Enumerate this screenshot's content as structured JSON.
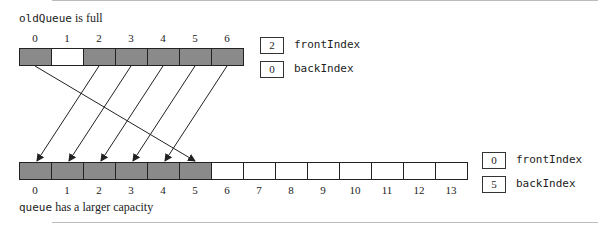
{
  "top": {
    "caption_code": "oldQueue",
    "caption_text": " is full",
    "indices": [
      "0",
      "1",
      "2",
      "3",
      "4",
      "5",
      "6"
    ],
    "filled": [
      true,
      false,
      true,
      true,
      true,
      true,
      true
    ],
    "front_value": "2",
    "front_label": "frontIndex",
    "back_value": "0",
    "back_label": "backIndex"
  },
  "bottom": {
    "caption_code": "queue",
    "caption_text": " has a larger capacity",
    "indices": [
      "0",
      "1",
      "2",
      "3",
      "4",
      "5",
      "6",
      "7",
      "8",
      "9",
      "10",
      "11",
      "12",
      "13"
    ],
    "filled": [
      true,
      true,
      true,
      true,
      true,
      true,
      false,
      false,
      false,
      false,
      false,
      false,
      false,
      false
    ],
    "front_value": "0",
    "front_label": "frontIndex",
    "back_value": "5",
    "back_label": "backIndex"
  },
  "arrows": [
    {
      "from": 2,
      "to": 0
    },
    {
      "from": 3,
      "to": 1
    },
    {
      "from": 4,
      "to": 2
    },
    {
      "from": 5,
      "to": 3
    },
    {
      "from": 6,
      "to": 4
    },
    {
      "from": 0,
      "to": 5
    }
  ],
  "colors": {
    "filled": "#8a8a8a",
    "empty": "#ffffff"
  }
}
